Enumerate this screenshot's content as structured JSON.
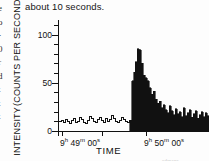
{
  "page": {
    "caption_fragment": "about 10 seconds.",
    "edge_column_lines": [
      "e",
      "o",
      "-",
      "0",
      "r",
      "d",
      "t",
      "t",
      "t"
    ],
    "watermark": "admaps"
  },
  "chart_data": {
    "type": "line",
    "title": "",
    "xlabel": "TIME",
    "ylabel_line1": "INTENSITY",
    "ylabel_line2": "(COUNTS PER SECOND)",
    "ylim": [
      0,
      115
    ],
    "yticks_major": [
      0,
      50,
      100
    ],
    "yticks_major_labels": [
      "0",
      "50",
      "100"
    ],
    "yticks_minor": [
      10,
      20,
      30,
      40,
      60,
      70,
      80,
      90,
      110
    ],
    "grid": false,
    "legend": null,
    "xtick_positions_s": [
      0,
      20,
      60
    ],
    "xtick_labels": [
      {
        "hour": "9",
        "min": "49",
        "sec": "00",
        "text": "9h 49m 00s"
      },
      {
        "hour": "9",
        "min": "50",
        "sec": "00",
        "text": "9h 50m 00s"
      }
    ],
    "xlabel_shown": [
      "9h 49m 00s",
      "9h 50m 00s"
    ],
    "xlim_s": [
      -2,
      74
    ],
    "burst_onset_s": 34,
    "peak_value": 85,
    "baseline_mean": 11,
    "series": [
      {
        "name": "pre-burst background (outline histogram)",
        "filled": false,
        "x": [
          -2,
          0,
          1,
          2,
          3,
          4,
          5,
          6,
          7,
          8,
          9,
          10,
          11,
          12,
          13,
          14,
          15,
          16,
          17,
          18,
          19,
          20,
          21,
          22,
          23,
          24,
          25,
          26,
          27,
          28,
          29,
          30,
          31,
          32,
          33,
          34
        ],
        "values": [
          10,
          11,
          9,
          12,
          10,
          8,
          11,
          13,
          9,
          10,
          14,
          12,
          9,
          8,
          11,
          15,
          13,
          10,
          9,
          12,
          14,
          11,
          9,
          13,
          10,
          12,
          16,
          13,
          10,
          9,
          11,
          14,
          12,
          10,
          9,
          11
        ]
      },
      {
        "name": "burst (filled histogram)",
        "filled": true,
        "x": [
          34,
          35,
          36,
          37,
          38,
          39,
          40,
          41,
          42,
          43,
          44,
          45,
          46,
          47,
          48,
          49,
          50,
          51,
          52,
          53,
          54,
          55,
          56,
          57,
          58,
          59,
          60,
          61,
          62,
          63,
          64,
          65,
          66,
          67,
          68,
          69,
          70,
          71,
          72,
          73,
          74
        ],
        "values": [
          11,
          52,
          61,
          72,
          85,
          84,
          70,
          58,
          55,
          52,
          45,
          38,
          41,
          33,
          29,
          31,
          24,
          27,
          22,
          19,
          26,
          21,
          17,
          23,
          18,
          20,
          15,
          24,
          16,
          19,
          22,
          14,
          18,
          21,
          13,
          17,
          20,
          15,
          19,
          16,
          26
        ]
      }
    ]
  }
}
